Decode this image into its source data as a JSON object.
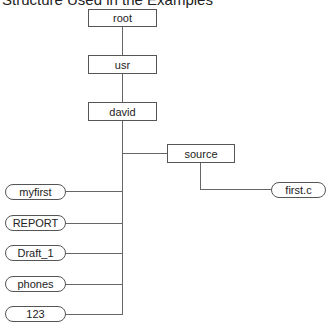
{
  "title": "Structure Used in the Examples",
  "nodes": {
    "root": "root",
    "usr": "usr",
    "david": "david",
    "source": "source",
    "first_c": "first.c",
    "myfirst": "myfirst",
    "report": "REPORT",
    "draft_1": "Draft_1",
    "phones": "phones",
    "n123": "123"
  },
  "legend": {
    "directory_shape": "rectangle",
    "file_shape": "rounded-pill"
  }
}
